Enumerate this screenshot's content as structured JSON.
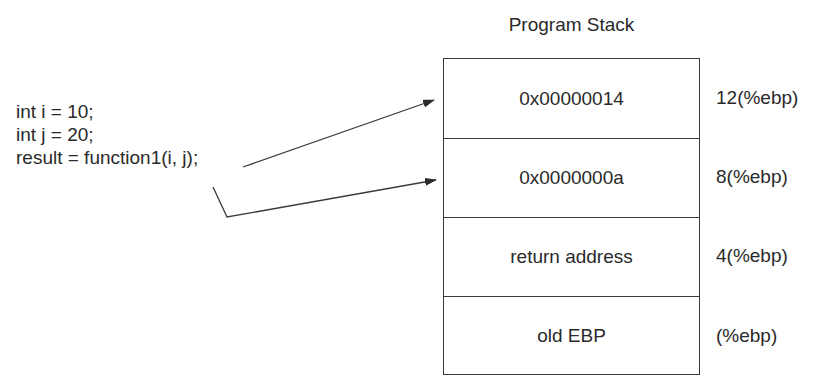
{
  "code": {
    "lines": [
      "int i = 10;",
      "int j = 20;",
      "result = function1(i, j);"
    ]
  },
  "stack": {
    "title": "Program Stack",
    "cells": [
      {
        "value": "0x00000014",
        "offset": "12(%ebp)"
      },
      {
        "value": "0x0000000a",
        "offset": "8(%ebp)"
      },
      {
        "value": "return address",
        "offset": "4(%ebp)"
      },
      {
        "value": "old EBP",
        "offset": "(%ebp)"
      }
    ]
  },
  "arrows": [
    {
      "from": "function1 argument j",
      "to": "0x00000014"
    },
    {
      "from": "function1 argument i",
      "to": "0x0000000a"
    }
  ],
  "colors": {
    "line": "#3a3a3a",
    "text": "#2a2a2a",
    "background": "#ffffff"
  }
}
